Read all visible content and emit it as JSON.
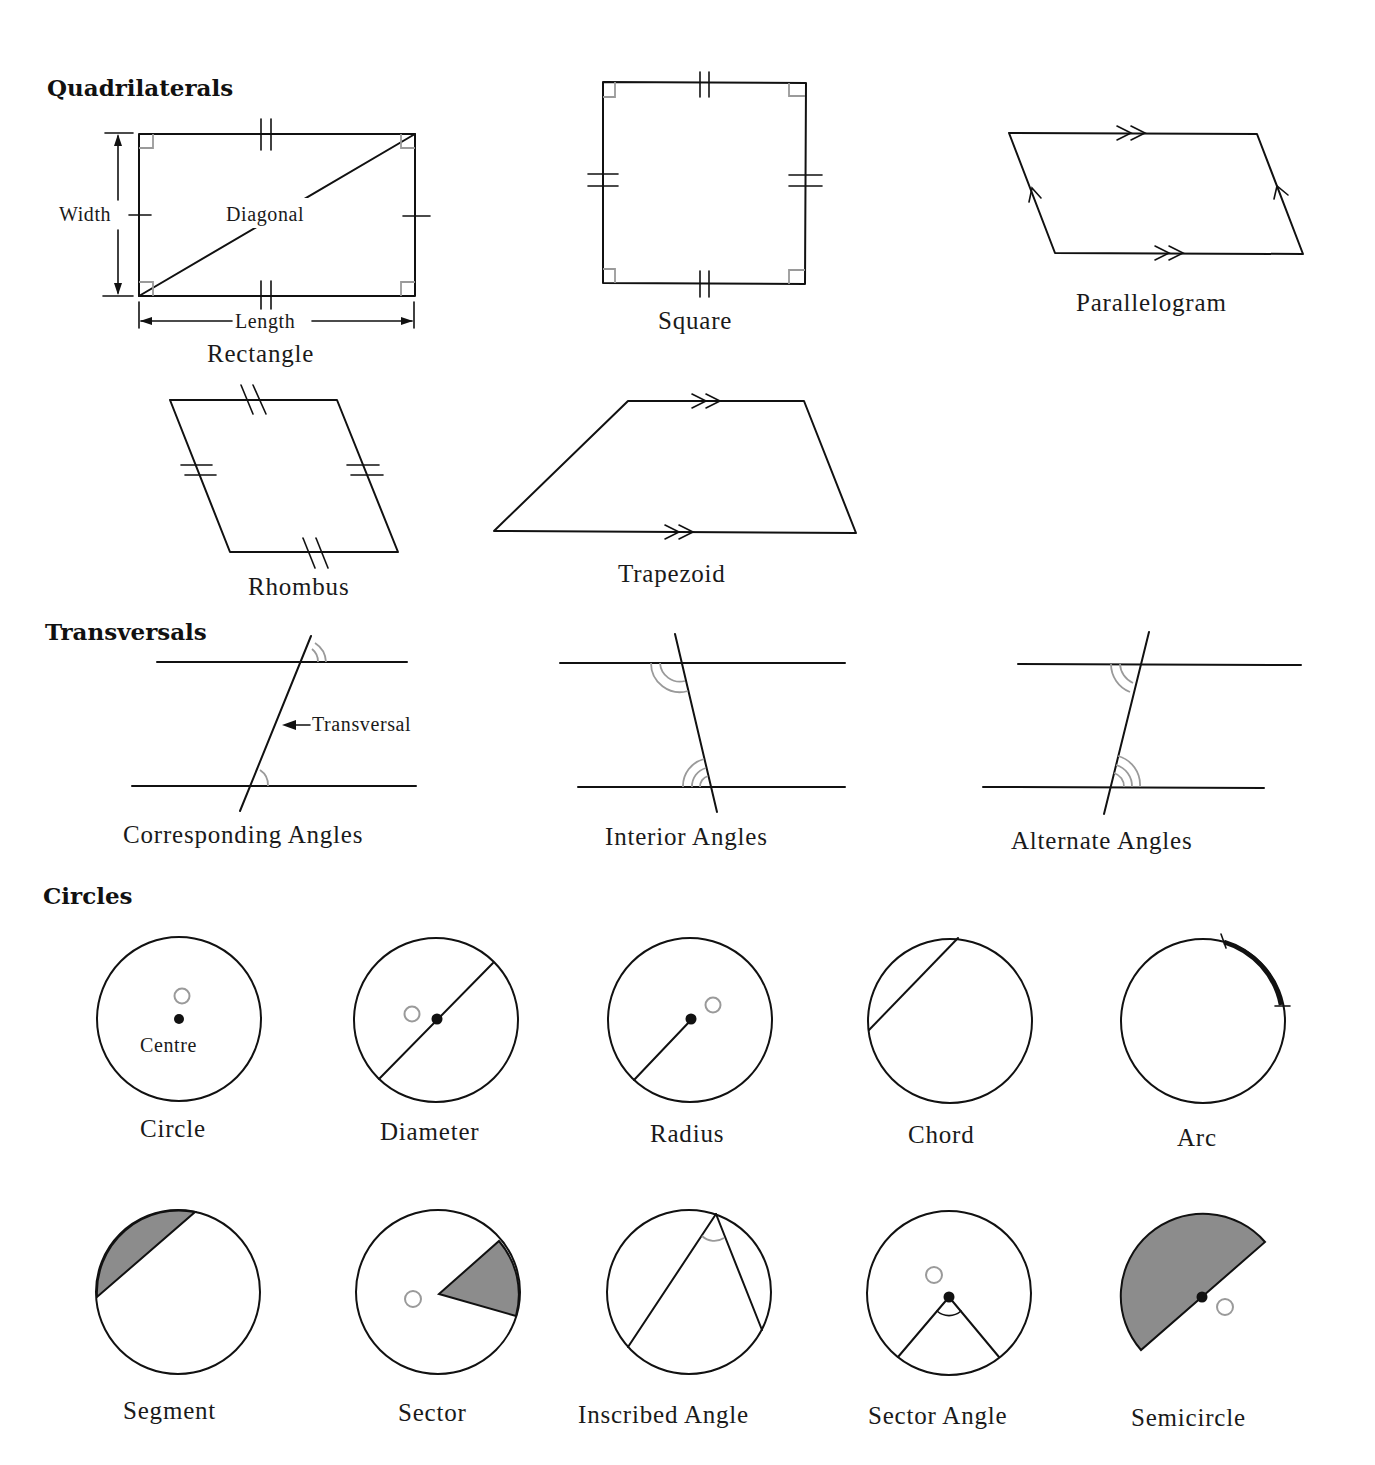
{
  "sections": {
    "quadrilaterals": "Quadrilaterals",
    "transversals": "Transversals",
    "circles": "Circles"
  },
  "quadrilaterals": {
    "rectangle": {
      "name": "Rectangle",
      "width_label": "Width",
      "diagonal_label": "Diagonal",
      "length_label": "Length"
    },
    "square": {
      "name": "Square"
    },
    "parallelogram": {
      "name": "Parallelogram"
    },
    "rhombus": {
      "name": "Rhombus"
    },
    "trapezoid": {
      "name": "Trapezoid"
    }
  },
  "transversals": {
    "corresponding": {
      "name": "Corresponding Angles",
      "pointer_label": "Transversal"
    },
    "interior": {
      "name": "Interior Angles"
    },
    "alternate": {
      "name": "Alternate Angles"
    }
  },
  "circles": {
    "row1": [
      {
        "name": "Circle",
        "inner_label": "Centre"
      },
      {
        "name": "Diameter"
      },
      {
        "name": "Radius"
      },
      {
        "name": "Chord"
      },
      {
        "name": "Arc"
      }
    ],
    "row2": [
      {
        "name": "Segment"
      },
      {
        "name": "Sector"
      },
      {
        "name": "Inscribed Angle"
      },
      {
        "name": "Sector Angle"
      },
      {
        "name": "Semicircle"
      }
    ]
  },
  "colors": {
    "line": "#111111",
    "construction_mark": "#9a9a9a",
    "shaded_region": "#8c8c8c",
    "background": "#ffffff"
  }
}
